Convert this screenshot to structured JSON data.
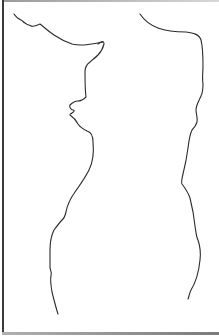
{
  "artwork": {
    "subject": "continuous line drawing of a female torso in profile",
    "style": "minimal black ink contour on white paper",
    "colors": {
      "background": "#ffffff",
      "line": "#2a2a2a",
      "frame_left": "#3a3a3a",
      "frame_edges": "#9a9a9a"
    }
  }
}
